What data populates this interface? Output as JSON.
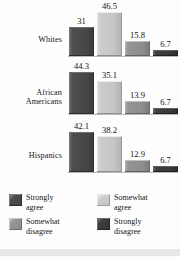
{
  "chart_data": {
    "type": "bar",
    "orientation": "vertical",
    "grouping": "grouped",
    "title": "",
    "subtitle": "",
    "xlabel": "",
    "ylabel": "",
    "ylim": [
      0,
      50
    ],
    "grid": false,
    "legend_position": "bottom",
    "categories": [
      "Whites",
      "African Americans",
      "Hispanics"
    ],
    "series": [
      {
        "name": "Strongly agree",
        "color": "#474747",
        "values": [
          31,
          44.3,
          42.1
        ]
      },
      {
        "name": "Somewhat agree",
        "color": "#c6c6c6",
        "values": [
          46.5,
          35.1,
          38.2
        ]
      },
      {
        "name": "Somewhat disagree",
        "color": "#8e8e8e",
        "values": [
          15.8,
          13.9,
          12.9
        ]
      },
      {
        "name": "Strongly disagree",
        "color": "#383838",
        "values": [
          6.7,
          6.7,
          6.7
        ]
      }
    ],
    "groups": [
      {
        "label": "Whites",
        "label_lines": [
          "Whites"
        ],
        "bars": [
          {
            "series": "Strongly agree",
            "value": 31,
            "value_label": "31"
          },
          {
            "series": "Somewhat agree",
            "value": 46.5,
            "value_label": "46.5"
          },
          {
            "series": "Somewhat disagree",
            "value": 15.8,
            "value_label": "15.8"
          },
          {
            "series": "Strongly disagree",
            "value": 6.7,
            "value_label": "6.7"
          }
        ]
      },
      {
        "label": "African Americans",
        "label_lines": [
          "African",
          "Americans"
        ],
        "bars": [
          {
            "series": "Strongly agree",
            "value": 44.3,
            "value_label": "44.3"
          },
          {
            "series": "Somewhat agree",
            "value": 35.1,
            "value_label": "35.1"
          },
          {
            "series": "Somewhat disagree",
            "value": 13.9,
            "value_label": "13.9"
          },
          {
            "series": "Strongly disagree",
            "value": 6.7,
            "value_label": "6.7"
          }
        ]
      },
      {
        "label": "Hispanics",
        "label_lines": [
          "Hispanics"
        ],
        "bars": [
          {
            "series": "Strongly agree",
            "value": 42.1,
            "value_label": "42.1"
          },
          {
            "series": "Somewhat agree",
            "value": 38.2,
            "value_label": "38.2"
          },
          {
            "series": "Somewhat disagree",
            "value": 12.9,
            "value_label": "12.9"
          },
          {
            "series": "Strongly disagree",
            "value": 6.7,
            "value_label": "6.7"
          }
        ]
      }
    ],
    "legend": [
      {
        "label_lines": [
          "Strongly",
          "agree"
        ],
        "label": "Strongly agree",
        "color": "#474747"
      },
      {
        "label_lines": [
          "Somewhat",
          "agree"
        ],
        "label": "Somewhat agree",
        "color": "#c6c6c6"
      },
      {
        "label_lines": [
          "Somewhat",
          "disagree"
        ],
        "label": "Somewhat disagree",
        "color": "#8e8e8e"
      },
      {
        "label_lines": [
          "Strongly",
          "disagree"
        ],
        "label": "Strongly disagree",
        "color": "#383838"
      }
    ]
  }
}
